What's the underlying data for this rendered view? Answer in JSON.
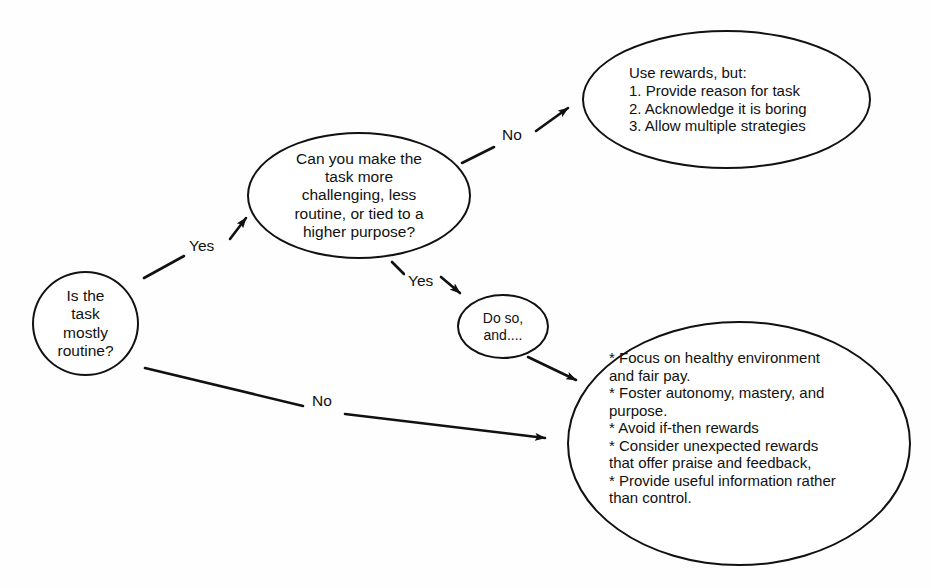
{
  "diagram": {
    "background_color": "#fefefe",
    "stroke_color": "#111111",
    "nodes": {
      "start": {
        "text": "Is the\ntask\nmostly\nroutine?",
        "shape": "circle"
      },
      "question": {
        "text": "Can you make the\ntask more\nchallenging, less\nroutine, or tied to a\nhigher purpose?",
        "shape": "ellipse"
      },
      "rewards": {
        "text": "Use rewards, but:\n1. Provide reason for task\n2. Acknowledge it is boring\n3. Allow multiple strategies",
        "shape": "ellipse"
      },
      "doso": {
        "text": "Do so,\nand....",
        "shape": "ellipse"
      },
      "practices": {
        "text": "* Focus on healthy environment\n   and fair pay.\n* Foster autonomy, mastery, and\n   purpose.\n* Avoid if-then rewards\n* Consider unexpected rewards\n   that offer praise and feedback,\n* Provide useful information rather\n   than control.",
        "shape": "ellipse"
      }
    },
    "edges": [
      {
        "id": "start-to-question",
        "label": "Yes",
        "from": "start",
        "to": "question"
      },
      {
        "id": "question-to-rewards",
        "label": "No",
        "from": "question",
        "to": "rewards"
      },
      {
        "id": "question-to-doso",
        "label": "Yes",
        "from": "question",
        "to": "doso"
      },
      {
        "id": "start-to-practices",
        "label": "No",
        "from": "start",
        "to": "practices"
      },
      {
        "id": "doso-to-practices",
        "label": "",
        "from": "doso",
        "to": "practices"
      }
    ]
  }
}
